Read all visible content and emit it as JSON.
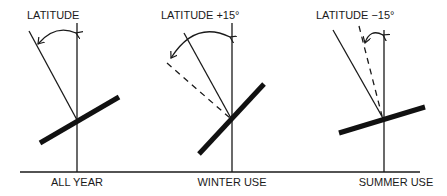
{
  "diagram": {
    "panels": [
      {
        "top_label": "LATITUDE",
        "bottom_label": "ALL YEAR",
        "tilt_offset_deg": 0
      },
      {
        "top_label": "LATITUDE +15°",
        "bottom_label": "WINTER USE",
        "tilt_offset_deg": 15
      },
      {
        "top_label": "LATITUDE −15°",
        "bottom_label": "SUMMER USE",
        "tilt_offset_deg": -15
      }
    ]
  }
}
